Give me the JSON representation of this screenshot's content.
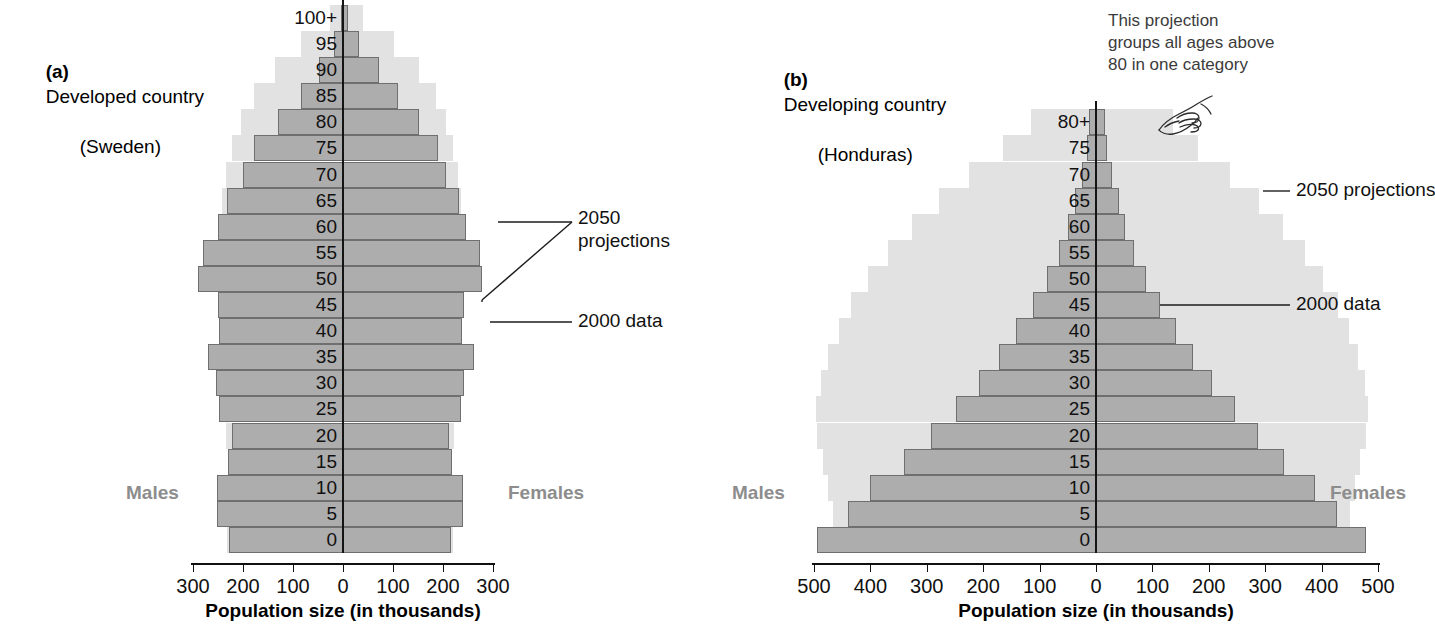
{
  "figure": {
    "panels": [
      {
        "id": "sweden",
        "tag": "(a)",
        "title": "Developed country\n(Honduras-placeholder)",
        "title_line1": "Developed country",
        "title_line2": "(Sweden)",
        "males_label": "Males",
        "females_label": "Females",
        "axis_title": "Population size (in thousands)",
        "annotations": [
          {
            "id": "proj",
            "text": "2050\nprojections"
          },
          {
            "id": "data",
            "text": "2000 data"
          }
        ]
      },
      {
        "id": "honduras",
        "tag": "(b)",
        "title_line1": "Developing country",
        "title_line2": "(Honduras)",
        "males_label": "Males",
        "females_label": "Females",
        "axis_title": "Population size (in thousands)",
        "annotations": [
          {
            "id": "proj",
            "text": "2050 projections"
          },
          {
            "id": "data",
            "text": "2000 data"
          },
          {
            "id": "callout",
            "text": "This projection\ngroups all ages above\n80 in one category"
          }
        ]
      }
    ],
    "colors": {
      "data_2000_fill": "#adadad",
      "data_2000_stroke": "#6f6f6f",
      "projection_2050_fill": "#e2e2e2",
      "projection_outline": "#ffffff",
      "axis": "#111111",
      "sex_label": "#8d8d8d",
      "background": "#ffffff"
    },
    "icons": [
      {
        "name": "pointing-hand-icon",
        "panel": "honduras"
      }
    ]
  },
  "chart_data": [
    {
      "type": "bar",
      "subtype": "population-pyramid",
      "id": "sweden",
      "title": "(a) Developed country (Sweden)",
      "xlabel": "Population size (in thousands)",
      "ylabel": "",
      "xlim": [
        -300,
        300
      ],
      "xticks": [
        300,
        200,
        100,
        0,
        100,
        200,
        300
      ],
      "xtick_labels": [
        "300",
        "200",
        "100",
        "0",
        "100",
        "200",
        "300"
      ],
      "grid": false,
      "legend_position": "annotation-callouts",
      "categories": [
        "0",
        "5",
        "10",
        "15",
        "20",
        "25",
        "30",
        "35",
        "40",
        "45",
        "50",
        "55",
        "60",
        "65",
        "70",
        "75",
        "80",
        "85",
        "90",
        "95",
        "100+"
      ],
      "series": [
        {
          "name": "2000 data",
          "side": "males",
          "values": [
            228,
            252,
            252,
            230,
            222,
            248,
            254,
            270,
            248,
            250,
            290,
            280,
            250,
            232,
            200,
            178,
            130,
            85,
            48,
            18,
            4
          ]
        },
        {
          "name": "2000 data",
          "side": "females",
          "values": [
            216,
            240,
            240,
            218,
            212,
            236,
            242,
            262,
            238,
            242,
            278,
            274,
            246,
            232,
            206,
            190,
            152,
            110,
            72,
            32,
            9
          ]
        },
        {
          "name": "2050 projections",
          "side": "males",
          "values": [
            236,
            236,
            222,
            222,
            238,
            238,
            248,
            246,
            250,
            250,
            252,
            254,
            252,
            246,
            238,
            226,
            208,
            182,
            140,
            88,
            30
          ]
        },
        {
          "name": "2050 projections",
          "side": "females",
          "values": [
            224,
            224,
            212,
            212,
            226,
            226,
            236,
            234,
            238,
            238,
            240,
            244,
            244,
            240,
            234,
            224,
            210,
            190,
            156,
            106,
            44
          ]
        }
      ]
    },
    {
      "type": "bar",
      "subtype": "population-pyramid",
      "id": "honduras",
      "title": "(b) Developing country (Honduras)",
      "xlabel": "Population size (in thousands)",
      "ylabel": "",
      "xlim": [
        -500,
        500
      ],
      "xticks": [
        500,
        400,
        300,
        200,
        100,
        0,
        100,
        200,
        300,
        400,
        500
      ],
      "xtick_labels": [
        "500",
        "400",
        "300",
        "200",
        "100",
        "0",
        "100",
        "200",
        "300",
        "400",
        "500"
      ],
      "grid": false,
      "legend_position": "annotation-callouts",
      "categories": [
        "0",
        "5",
        "10",
        "15",
        "20",
        "25",
        "30",
        "35",
        "40",
        "45",
        "50",
        "55",
        "60",
        "65",
        "70",
        "75",
        "80+"
      ],
      "series": [
        {
          "name": "2000 data",
          "side": "males",
          "values": [
            495,
            440,
            400,
            340,
            292,
            248,
            208,
            172,
            142,
            112,
            86,
            66,
            50,
            37,
            25,
            16,
            12
          ]
        },
        {
          "name": "2000 data",
          "side": "females",
          "values": [
            478,
            428,
            388,
            334,
            288,
            246,
            206,
            172,
            142,
            114,
            88,
            68,
            52,
            40,
            28,
            19,
            16
          ]
        },
        {
          "name": "2050 projections",
          "side": "males",
          "values": [
            462,
            470,
            478,
            488,
            498,
            500,
            492,
            478,
            460,
            438,
            408,
            372,
            330,
            282,
            228,
            168,
            118
          ]
        },
        {
          "name": "2050 projections",
          "side": "females",
          "values": [
            446,
            454,
            462,
            472,
            482,
            486,
            480,
            468,
            452,
            432,
            406,
            374,
            336,
            292,
            242,
            184,
            140
          ]
        }
      ]
    }
  ]
}
